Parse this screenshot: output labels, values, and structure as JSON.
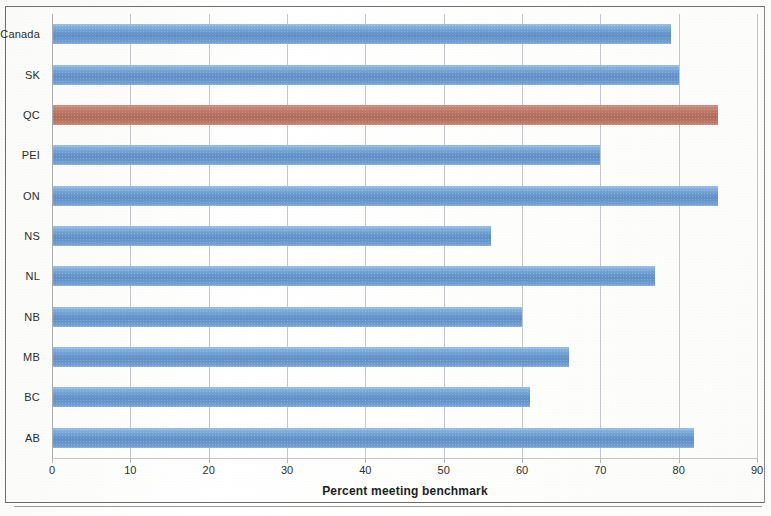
{
  "chart_data": {
    "type": "bar",
    "orientation": "horizontal",
    "title": "",
    "xlabel": "Percent meeting benchmark",
    "ylabel": "",
    "xlim": [
      0,
      90
    ],
    "xticks": [
      0,
      10,
      20,
      30,
      40,
      50,
      60,
      70,
      80,
      90
    ],
    "xtick_labels": [
      "0",
      "10",
      "20",
      "30",
      "40",
      "50",
      "60",
      "70",
      "80",
      "90"
    ],
    "grid": "vertical",
    "legend": "none",
    "categories": [
      "Canada",
      "SK",
      "QC",
      "PEI",
      "ON",
      "NS",
      "NL",
      "NB",
      "MB",
      "BC",
      "AB"
    ],
    "values": [
      79,
      80,
      85,
      70,
      85,
      56,
      77,
      60,
      66,
      61,
      82
    ],
    "bar_colors": [
      "blue",
      "blue",
      "red",
      "blue",
      "blue",
      "blue",
      "blue",
      "blue",
      "blue",
      "blue",
      "blue"
    ],
    "series": [
      {
        "name": "Percent meeting benchmark",
        "values": [
          79,
          80,
          85,
          70,
          85,
          56,
          77,
          60,
          66,
          61,
          82
        ]
      }
    ],
    "highlight_category": "QC",
    "colors": {
      "bar_blue": "#5e8fc6",
      "bar_red": "#b26b5a",
      "gridline": "#b9bcc2",
      "axis": "#a9acb1",
      "text": "#2b2b2b",
      "frame": "#6f6f6f",
      "background": "#ffffff"
    }
  }
}
